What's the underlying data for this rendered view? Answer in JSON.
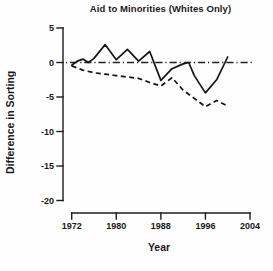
{
  "chart_data": {
    "type": "line",
    "title": "Aid to Minorities (Whites Only)",
    "xlabel": "Year",
    "ylabel": "Difference in Sorting",
    "xlim": [
      1972,
      2004
    ],
    "ylim": [
      -20,
      5
    ],
    "x_ticks": [
      1972,
      1980,
      1988,
      1996,
      2004
    ],
    "y_ticks": [
      5,
      0,
      -5,
      -10,
      -15,
      -20
    ],
    "grid": false,
    "legend": "none",
    "axis_color": "#1c1c1c",
    "line_color": "#161616",
    "reference_line": {
      "y": 0,
      "style": "dash-dot"
    },
    "series": [
      {
        "name": "solid-line",
        "style": "solid",
        "x": [
          1972,
          1973,
          1974,
          1975,
          1976,
          1978,
          1980,
          1982,
          1984,
          1986,
          1988,
          1990,
          1992,
          1993,
          1994,
          1996,
          1998,
          2000
        ],
        "y": [
          -0.4,
          0.2,
          0.5,
          0.0,
          0.6,
          2.6,
          0.4,
          1.9,
          0.2,
          1.6,
          -2.6,
          -0.9,
          -0.2,
          0.0,
          -1.9,
          -4.4,
          -2.5,
          0.8
        ]
      },
      {
        "name": "dashed-line",
        "style": "dashed",
        "x": [
          1972,
          1974,
          1976,
          1978,
          1980,
          1982,
          1984,
          1986,
          1988,
          1990,
          1992,
          1994,
          1996,
          1998,
          2000
        ],
        "y": [
          -0.5,
          -1.1,
          -1.5,
          -1.7,
          -1.9,
          -2.1,
          -2.3,
          -2.9,
          -3.4,
          -2.2,
          -4.0,
          -5.2,
          -6.4,
          -5.5,
          -6.3
        ]
      }
    ]
  }
}
